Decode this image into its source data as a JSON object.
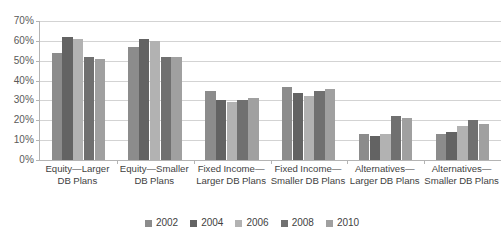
{
  "chart_data": {
    "type": "bar",
    "title": "",
    "subtitle": "",
    "xlabel": "",
    "ylabel": "",
    "ylim": [
      0,
      70
    ],
    "y_tick_step": 10,
    "y_tick_labels": [
      "70%",
      "60%",
      "50%",
      "40%",
      "30%",
      "20%",
      "10%",
      "0%"
    ],
    "y_tick_values": [
      70,
      60,
      50,
      40,
      30,
      20,
      10,
      0
    ],
    "grid": true,
    "grid_axis": "y",
    "legend_position": "bottom",
    "value_unit": "percent",
    "categories": [
      "Equity—Larger DB Plans",
      "Equity—Smaller DB Plans",
      "Fixed Income—Larger DB Plans",
      "Fixed Income—Smaller DB Plans",
      "Alternatives—Larger DB Plans",
      "Alternatives—Smaller DB Plans"
    ],
    "series": [
      {
        "name": "2002",
        "color": "#8c8c8c",
        "values": [
          54,
          57,
          35,
          37,
          13,
          13
        ]
      },
      {
        "name": "2004",
        "color": "#636363",
        "values": [
          62,
          61,
          30,
          34,
          12,
          14
        ]
      },
      {
        "name": "2006",
        "color": "#b2b2b2",
        "values": [
          61,
          60,
          29,
          32,
          13,
          17
        ]
      },
      {
        "name": "2008",
        "color": "#707070",
        "values": [
          52,
          52,
          30,
          35,
          22,
          20
        ]
      },
      {
        "name": "2010",
        "color": "#a0a0a0",
        "values": [
          51,
          52,
          31,
          36,
          21,
          18
        ]
      }
    ]
  },
  "colors": {
    "gridline": "#d3d3d3",
    "axis": "#b4b4b4",
    "text": "#3f3f3f",
    "tick_text": "#595959",
    "background": "#ffffff"
  }
}
